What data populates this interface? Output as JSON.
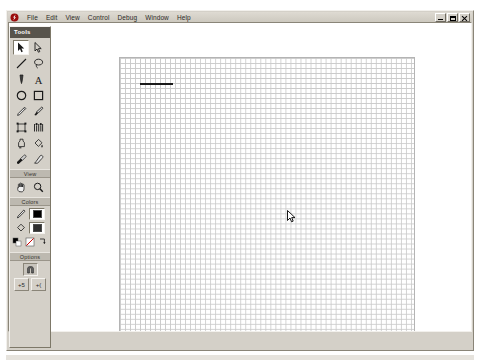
{
  "application": {
    "name": "Macromedia Flash",
    "app_icon": "flash-app-icon"
  },
  "menubar": {
    "items": [
      {
        "label": "File",
        "name": "menu-file"
      },
      {
        "label": "Edit",
        "name": "menu-edit"
      },
      {
        "label": "View",
        "name": "menu-view"
      },
      {
        "label": "Control",
        "name": "menu-control"
      },
      {
        "label": "Debug",
        "name": "menu-debug"
      },
      {
        "label": "Window",
        "name": "menu-window"
      },
      {
        "label": "Help",
        "name": "menu-help"
      }
    ]
  },
  "window_controls": {
    "minimize": {
      "label": "Minimize",
      "icon": "minimize-icon"
    },
    "restore": {
      "label": "Restore",
      "icon": "restore-icon"
    },
    "close": {
      "label": "Close",
      "icon": "close-icon"
    }
  },
  "tools_panel": {
    "title": "Tools",
    "sections": {
      "tools_label": "",
      "view_label": "View",
      "colors_label": "Colors",
      "options_label": "Options"
    },
    "tools": [
      {
        "name": "arrow-tool",
        "icon": "arrow-icon",
        "selected": true
      },
      {
        "name": "subselect-tool",
        "icon": "subselect-arrow-icon",
        "selected": false
      },
      {
        "name": "line-tool",
        "icon": "line-icon",
        "selected": false
      },
      {
        "name": "lasso-tool",
        "icon": "lasso-icon",
        "selected": false
      },
      {
        "name": "pen-tool",
        "icon": "pen-icon",
        "selected": false
      },
      {
        "name": "text-tool",
        "icon": "text-a-icon",
        "selected": false
      },
      {
        "name": "oval-tool",
        "icon": "oval-icon",
        "selected": false
      },
      {
        "name": "rectangle-tool",
        "icon": "rectangle-icon",
        "selected": false
      },
      {
        "name": "pencil-tool",
        "icon": "pencil-icon",
        "selected": false
      },
      {
        "name": "brush-tool",
        "icon": "brush-icon",
        "selected": false
      },
      {
        "name": "free-transform-tool",
        "icon": "free-transform-icon",
        "selected": false
      },
      {
        "name": "fill-transform-tool",
        "icon": "fill-transform-icon",
        "selected": false
      },
      {
        "name": "ink-bottle-tool",
        "icon": "ink-bottle-icon",
        "selected": false
      },
      {
        "name": "paint-bucket-tool",
        "icon": "paint-bucket-icon",
        "selected": false
      },
      {
        "name": "eyedropper-tool",
        "icon": "eyedropper-icon",
        "selected": false
      },
      {
        "name": "eraser-tool",
        "icon": "eraser-icon",
        "selected": false
      }
    ],
    "view_tools": [
      {
        "name": "hand-tool",
        "icon": "hand-icon"
      },
      {
        "name": "zoom-tool",
        "icon": "magnifier-icon"
      }
    ],
    "colors": {
      "stroke": {
        "name": "stroke-color",
        "icon": "pencil-stroke-icon",
        "value": "#000000"
      },
      "fill": {
        "name": "fill-color",
        "icon": "paint-bucket-fill-icon",
        "value": "#ffffff"
      },
      "black_and_white": {
        "name": "black-and-white-button",
        "icon": "black-white-icon"
      },
      "no_color": {
        "name": "no-color-button",
        "icon": "no-color-icon"
      },
      "swap_colors": {
        "name": "swap-colors-button",
        "icon": "swap-colors-icon"
      }
    },
    "options": [
      {
        "name": "snap-to-objects-option",
        "icon": "magnet-icon",
        "label": "",
        "pressed": true
      },
      {
        "name": "smooth-option",
        "icon": "smooth-icon",
        "label": "+5"
      },
      {
        "name": "straighten-option",
        "icon": "straighten-icon",
        "label": "+("
      }
    ]
  },
  "stage": {
    "name": "drawing-stage",
    "grid": {
      "visible": true,
      "cell_size_px": 5,
      "color": "#c9c9c9"
    },
    "shapes": [
      {
        "name": "drawn-line",
        "type": "line",
        "color": "#1a1a1a",
        "x": 20,
        "y": 25,
        "length": 33,
        "thickness": 2
      }
    ],
    "cursor": {
      "name": "arrow-cursor",
      "x": 167,
      "y": 151
    }
  }
}
